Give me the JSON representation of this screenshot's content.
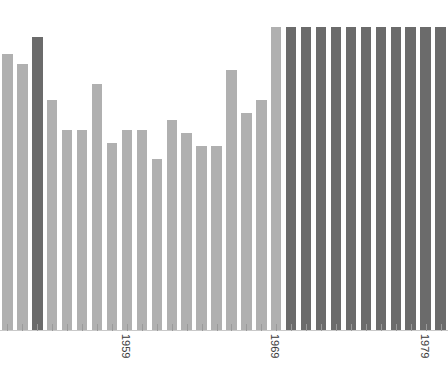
{
  "chart_data": {
    "type": "bar",
    "title": "",
    "subtitle": "",
    "xlabel": "",
    "ylabel": "",
    "grid": false,
    "legend": "none",
    "axis": {
      "baseline_y": 330,
      "x_tick_labels_rotated_degrees": 90,
      "ylim": [
        0,
        100
      ],
      "xlim_years": [
        1951,
        1980
      ]
    },
    "categories": [
      "1951",
      "1952",
      "1953",
      "1954",
      "1955",
      "1956",
      "1957",
      "1958",
      "1959",
      "1960",
      "1961",
      "1962",
      "1963",
      "1964",
      "1965",
      "1966",
      "1967",
      "1968",
      "1969",
      "1970",
      "1971",
      "1972",
      "1973",
      "1974",
      "1975",
      "1976",
      "1977",
      "1978",
      "1979",
      "1980"
    ],
    "values": [
      84,
      81,
      89,
      70,
      61,
      61,
      75,
      57,
      61,
      61,
      52,
      64,
      60,
      56,
      56,
      79,
      66,
      70,
      92,
      92,
      92,
      92,
      92,
      92,
      92,
      92,
      92,
      92,
      92,
      92
    ],
    "bar_colors": [
      "light",
      "light",
      "dark",
      "light",
      "light",
      "light",
      "light",
      "light",
      "light",
      "light",
      "light",
      "light",
      "light",
      "light",
      "light",
      "light",
      "light",
      "light",
      "light",
      "dark",
      "dark",
      "dark",
      "dark",
      "dark",
      "dark",
      "dark",
      "dark",
      "dark",
      "dark",
      "dark"
    ],
    "colors": {
      "light_bar": "#b0b0b0",
      "dark_bar": "#6b6b6b",
      "background": "#ffffff",
      "axis": "#c9c9c9",
      "tick": "#9a9a9a",
      "label_text": "#3a3a3a"
    },
    "visible_tick_labels": [
      {
        "label": "1959",
        "category_index": 8
      },
      {
        "label": "1969",
        "category_index": 18
      },
      {
        "label": "1979",
        "category_index": 28
      }
    ]
  }
}
